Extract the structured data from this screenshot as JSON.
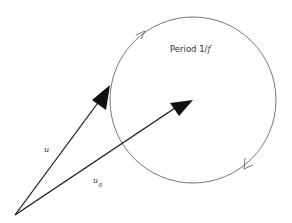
{
  "diagram": {
    "title_label": "Period 1/f",
    "period_text": "Period 1/",
    "period_var": "f",
    "vectors": [
      {
        "name": "u",
        "label": "u",
        "subscript": ""
      },
      {
        "name": "u_g",
        "label": "u",
        "subscript": "g"
      }
    ],
    "circle": {
      "description": "circular orbit with direction arrows"
    },
    "colors": {
      "stroke": "#222222",
      "circle": "#555555"
    }
  }
}
